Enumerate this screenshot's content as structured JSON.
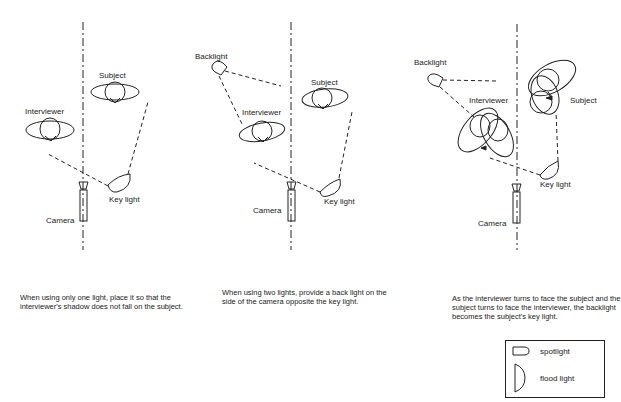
{
  "panels": [
    {
      "id": "one-light",
      "labels": {
        "subject": "Subject",
        "interviewer": "Interviewer",
        "key_light": "Key light",
        "camera": "Camera"
      },
      "caption": "When using only one light, place it so that the interviewer's shadow does not fall on the subject."
    },
    {
      "id": "two-lights",
      "labels": {
        "backlight": "Backlight",
        "subject": "Subject",
        "interviewer": "Interviewer",
        "key_light": "Key light",
        "camera": "Camera"
      },
      "caption": "When using two lights, provide a back light on the side of the camera opposite the key light."
    },
    {
      "id": "turning",
      "labels": {
        "backlight": "Backlight",
        "subject": "Subject",
        "interviewer": "Interviewer",
        "key_light": "Key light",
        "camera": "Camera"
      },
      "caption": "As the interviewer turns to face the subject and the subject turns to face the interviewer, the backlight becomes the subject's key light."
    }
  ],
  "legend": {
    "items": [
      {
        "symbol": "spotlight-icon",
        "label": "spotlight"
      },
      {
        "symbol": "flood-light-icon",
        "label": "flood light"
      }
    ]
  }
}
